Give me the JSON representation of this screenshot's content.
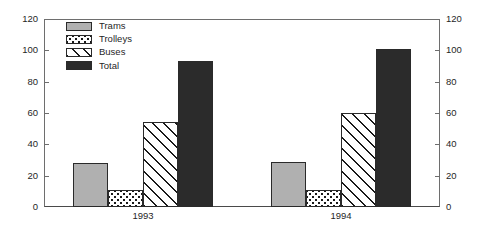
{
  "chart_data": {
    "type": "bar",
    "title": "",
    "subtitle": "",
    "xlabel": "",
    "ylabel": "",
    "categories": [
      "1993",
      "1994"
    ],
    "series": [
      {
        "name": "Trams",
        "values": [
          28,
          29
        ],
        "fill": "solid-gray",
        "color": "#b0b0b0"
      },
      {
        "name": "Trolleys",
        "values": [
          11,
          11
        ],
        "fill": "dotted",
        "color": "#ffffff"
      },
      {
        "name": "Buses",
        "values": [
          54,
          60
        ],
        "fill": "diagonal-hatch",
        "color": "#ffffff"
      },
      {
        "name": "Total",
        "values": [
          93,
          101
        ],
        "fill": "solid-dark",
        "color": "#2b2b2b"
      }
    ],
    "ylim": [
      0,
      120
    ],
    "y_ticks": [
      0,
      20,
      40,
      60,
      80,
      100,
      120
    ],
    "y_axis_left_labels": [
      "0",
      "20",
      "40",
      "60",
      "80",
      "100",
      "120"
    ],
    "y_axis_right_labels": [
      "0",
      "20",
      "40",
      "60",
      "80",
      "100",
      "120"
    ],
    "dual_axis": true,
    "grid": false,
    "legend_position": "top-left",
    "legend_entries": [
      "Trams",
      "Trolleys",
      "Buses",
      "Total"
    ],
    "axis_color": "#6e6e6e",
    "bar_outline_color": "#2a2a2a",
    "background": "#ffffff"
  }
}
